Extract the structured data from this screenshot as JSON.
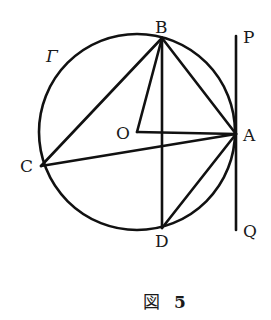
{
  "figure": {
    "caption_prefix": "図",
    "caption_number": "5",
    "circle_label": "Γ",
    "colors": {
      "ink": "#111111",
      "background": "#ffffff"
    },
    "circle": {
      "name": "Γ",
      "cx": 137,
      "cy": 132,
      "r": 98
    },
    "points": {
      "A": {
        "label": "A",
        "x": 236,
        "y": 134
      },
      "B": {
        "label": "B",
        "x": 162,
        "y": 38
      },
      "C": {
        "label": "C",
        "x": 41,
        "y": 166
      },
      "D": {
        "label": "D",
        "x": 162,
        "y": 228
      },
      "O": {
        "label": "O",
        "x": 137,
        "y": 132
      },
      "P": {
        "label": "P",
        "x": 236,
        "y": 36
      },
      "Q": {
        "label": "Q",
        "x": 236,
        "y": 230
      }
    },
    "segments": [
      "BC",
      "BA",
      "BO",
      "BD",
      "OA",
      "CA",
      "DA",
      "PQ"
    ],
    "tangent_line": "PQ tangent to Γ at A"
  }
}
